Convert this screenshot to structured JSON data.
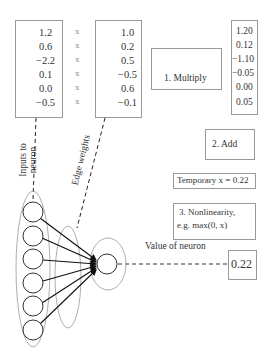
{
  "inputs": {
    "values": [
      "1.2",
      "0.6",
      "−2.2",
      "0.1",
      "0.0",
      "−0.5"
    ],
    "colors": [
      "#2b2b2b",
      "#8a8a8a",
      "#ffffff",
      "#a5a5a5",
      "#ffffff",
      "#cfcfcf"
    ]
  },
  "times_symbol": "x",
  "weights": {
    "values": [
      "1.0",
      "0.2",
      "0.5",
      "−0.5",
      "0.6",
      "−0.1"
    ],
    "colors": [
      "#2b2b2b",
      "#b5b5b5",
      "#8f8f8f",
      "#dedede",
      "#7d7d7d",
      "#c9c9c9"
    ]
  },
  "step1": {
    "label": "1. Multiply"
  },
  "products": {
    "values": [
      "1.20",
      "0.12",
      "−1.10",
      "−0.05",
      "0.00",
      "0.05"
    ]
  },
  "step2": {
    "label": "2. Add"
  },
  "temporary": {
    "label": "Temporary x = 0.22"
  },
  "step3": {
    "line1": "3. Nonlinearity,",
    "line2": "e.g. max(0, x)"
  },
  "value_of_neuron": {
    "label": "Value of neuron",
    "value": "0.22"
  },
  "labels": {
    "inputs_line1": "Inputs to",
    "inputs_line2": "neuron",
    "edge_weights": "Edge weights"
  },
  "colors": {
    "arrow": "#555555",
    "border": "#999999"
  }
}
